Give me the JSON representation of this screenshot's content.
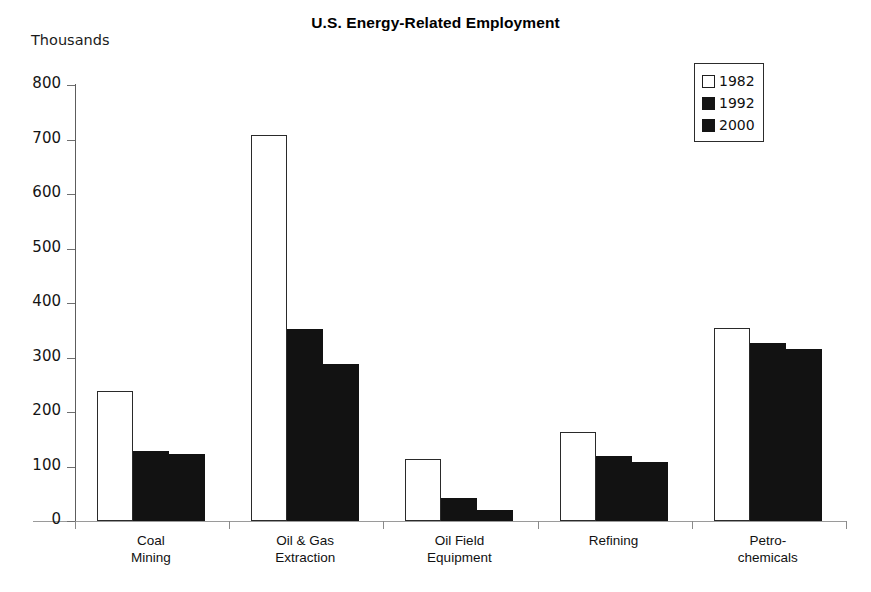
{
  "chart_data": {
    "type": "bar",
    "title": "U.S. Energy-Related Employment",
    "xlabel": "",
    "ylabel": "Thousands",
    "ylim": [
      0,
      800
    ],
    "yticks": [
      0,
      100,
      200,
      300,
      400,
      500,
      600,
      700,
      800
    ],
    "ytick_labels": [
      "0",
      "100",
      "200",
      "300",
      "400",
      "500",
      "600",
      "700",
      "800"
    ],
    "grid": false,
    "legend_position": "top-right",
    "categories": [
      "Coal\nMining",
      "Oil & Gas\nExtraction",
      "Oil Field\nEquipment",
      "Refining",
      "Petro-\nchemicals"
    ],
    "series": [
      {
        "name": "1982",
        "color": "#ffffff",
        "edge_color": "#2a2a2a",
        "values": [
          238,
          708,
          113,
          163,
          354
        ]
      },
      {
        "name": "1992",
        "color": "#121212",
        "edge_color": "#121212",
        "values": [
          128,
          353,
          42,
          120,
          327
        ]
      },
      {
        "name": "2000",
        "color": "#121212",
        "edge_color": "#121212",
        "values": [
          123,
          289,
          21,
          108,
          316
        ]
      }
    ]
  },
  "legend": {
    "items": [
      {
        "label": "1982",
        "style": "light"
      },
      {
        "label": "1992",
        "style": "dark"
      },
      {
        "label": "2000",
        "style": "dark"
      }
    ]
  }
}
